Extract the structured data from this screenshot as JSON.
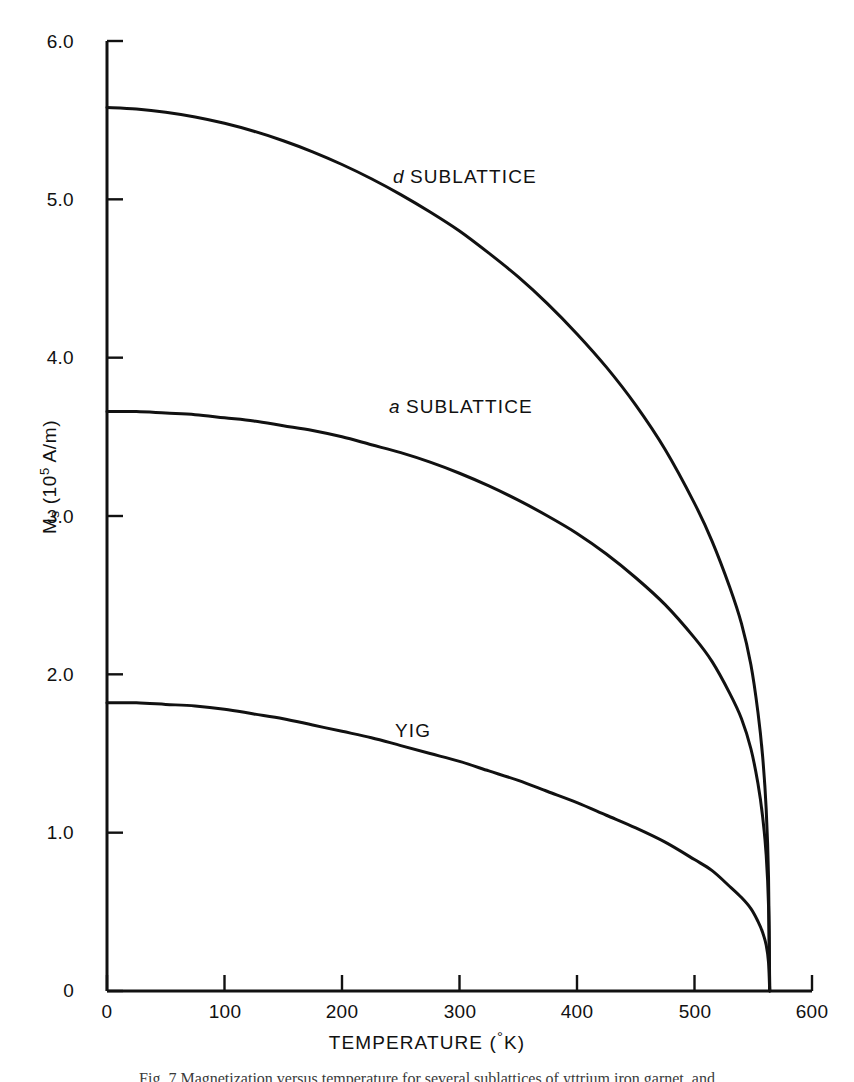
{
  "figure": {
    "caption": "Fig. 7  Magnetization versus temperature for several sublattices of yttrium iron garnet, and"
  },
  "chart_data": {
    "type": "line",
    "title": "",
    "xlabel": "TEMPERATURE (°K)",
    "ylabel": "Mₛ (10⁵ A/m)",
    "ylabel_parts": {
      "symbol": "M",
      "subscript": "s",
      "unit_prefix": "(10",
      "unit_exponent": "5",
      "unit_suffix": " A/m)"
    },
    "xlim": [
      0,
      600
    ],
    "ylim": [
      0,
      6.0
    ],
    "grid": false,
    "legend_position": "inline-annotations",
    "xticks": [
      0,
      100,
      200,
      300,
      400,
      500,
      600
    ],
    "xtick_labels": [
      "0",
      "100",
      "200",
      "300",
      "400",
      "500",
      "600"
    ],
    "yticks": [
      0,
      1.0,
      2.0,
      3.0,
      4.0,
      5.0,
      6.0
    ],
    "ytick_labels": [
      "0",
      "1.0",
      "2.0",
      "3.0",
      "4.0",
      "5.0",
      "6.0"
    ],
    "curie_temperature": 564,
    "annotations": [
      {
        "text": "d SUBLATTICE",
        "italic_prefix": "d",
        "rest": " SUBLATTICE",
        "x": 245,
        "y": 5.25
      },
      {
        "text": "a SUBLATTICE",
        "italic_prefix": "a",
        "rest": " SUBLATTICE",
        "x": 242,
        "y": 3.8
      },
      {
        "text": "YIG",
        "italic_prefix": "",
        "rest": "YIG",
        "x": 248,
        "y": 1.78
      }
    ],
    "series": [
      {
        "name": "d SUBLATTICE",
        "x": [
          0,
          25,
          50,
          75,
          100,
          125,
          150,
          175,
          200,
          225,
          250,
          275,
          300,
          325,
          350,
          375,
          400,
          425,
          450,
          475,
          500,
          515,
          530,
          540,
          548,
          554,
          558,
          561,
          563,
          564
        ],
        "values": [
          5.58,
          5.57,
          5.55,
          5.52,
          5.48,
          5.43,
          5.37,
          5.3,
          5.22,
          5.13,
          5.03,
          4.92,
          4.8,
          4.66,
          4.51,
          4.34,
          4.15,
          3.94,
          3.7,
          3.42,
          3.08,
          2.84,
          2.55,
          2.32,
          2.06,
          1.76,
          1.48,
          1.15,
          0.72,
          0.0
        ]
      },
      {
        "name": "a SUBLATTICE",
        "x": [
          0,
          25,
          50,
          75,
          100,
          125,
          150,
          175,
          200,
          225,
          250,
          275,
          300,
          325,
          350,
          375,
          400,
          425,
          450,
          475,
          500,
          515,
          530,
          540,
          548,
          554,
          558,
          561,
          563,
          564
        ],
        "values": [
          3.66,
          3.66,
          3.65,
          3.64,
          3.62,
          3.6,
          3.57,
          3.54,
          3.5,
          3.45,
          3.4,
          3.34,
          3.27,
          3.19,
          3.1,
          3.0,
          2.89,
          2.76,
          2.61,
          2.44,
          2.23,
          2.08,
          1.88,
          1.72,
          1.53,
          1.31,
          1.1,
          0.86,
          0.54,
          0.0
        ]
      },
      {
        "name": "YIG",
        "x": [
          0,
          25,
          50,
          75,
          100,
          125,
          150,
          175,
          200,
          225,
          250,
          275,
          300,
          325,
          350,
          375,
          400,
          425,
          450,
          475,
          500,
          515,
          530,
          540,
          548,
          554,
          558,
          561,
          563,
          564
        ],
        "values": [
          1.82,
          1.82,
          1.81,
          1.8,
          1.78,
          1.75,
          1.72,
          1.68,
          1.64,
          1.6,
          1.55,
          1.5,
          1.45,
          1.39,
          1.33,
          1.26,
          1.19,
          1.11,
          1.03,
          0.94,
          0.83,
          0.76,
          0.66,
          0.59,
          0.52,
          0.44,
          0.37,
          0.29,
          0.18,
          0.0
        ]
      }
    ],
    "style": {
      "line_color": "#111111",
      "line_width": 3.0,
      "axis_color": "#111111",
      "background": "#ffffff"
    }
  }
}
